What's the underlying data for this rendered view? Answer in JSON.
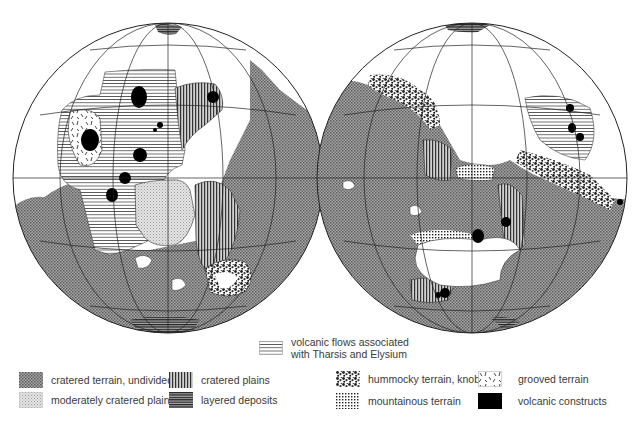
{
  "figure": {
    "type": "geologic map of two planetary hemispheres (Mars)",
    "globes": [
      {
        "id": "western-hemisphere",
        "center": [
          168,
          178
        ],
        "radius": 155
      },
      {
        "id": "eastern-hemisphere",
        "center": [
          472,
          178
        ],
        "radius": 155
      }
    ]
  },
  "legend": {
    "top_item": {
      "label_line1": "volcanic flows associated",
      "label_line2": "with Tharsis and Elysium",
      "pattern": "horizontal-lines"
    },
    "items": [
      {
        "label": "cratered terrain, undivided",
        "pattern": "fine-dark-stipple"
      },
      {
        "label": "moderately cratered plains",
        "pattern": "light-stipple"
      },
      {
        "label": "cratered plains",
        "pattern": "vertical-lines"
      },
      {
        "label": "layered deposits",
        "pattern": "dense-horizontal-lines"
      },
      {
        "label": "hummocky terrain, knobby",
        "pattern": "knobby"
      },
      {
        "label": "mountainous terrain",
        "pattern": "grid-dots"
      },
      {
        "label": "grooved terrain",
        "pattern": "grooves"
      },
      {
        "label": "volcanic constructs",
        "pattern": "solid-black"
      }
    ]
  },
  "colors": {
    "outline": "#222222",
    "cratered_terrain": "#8c8c8c",
    "volcanic_constructs": "#000000",
    "background": "#ffffff"
  }
}
